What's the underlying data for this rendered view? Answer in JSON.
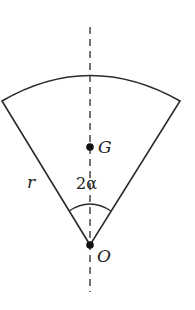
{
  "diagram": {
    "type": "circular-sector",
    "colors": {
      "stroke": "#2a2a2a",
      "background": "#ffffff"
    },
    "labels": {
      "centre_of_mass": "G",
      "apex": "O",
      "radius": "r",
      "angle": "2α"
    },
    "geometry": {
      "apex": [
        90,
        245
      ],
      "left_corner": [
        2,
        101
      ],
      "right_corner": [
        180,
        101
      ],
      "arc_top": [
        90,
        75
      ],
      "centre_of_mass_point": [
        90,
        147
      ],
      "axis_top_y": 27,
      "axis_bottom_y": 292,
      "angle_arc_radius": 40
    }
  }
}
